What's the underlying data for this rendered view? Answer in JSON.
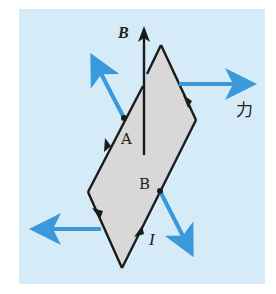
{
  "diagram": {
    "type": "physics-force-on-current-loop",
    "colors": {
      "background": "#d5ebf7",
      "loop_fill": "#d8d8d8",
      "loop_stroke": "#1a1a1a",
      "force_arrow": "#3a9ad9"
    },
    "labels": {
      "field": "B",
      "point_a": "A",
      "point_b": "B",
      "current": "I",
      "force": "力"
    },
    "loop_vertices": {
      "top": [
        161,
        45
      ],
      "right": [
        196,
        120
      ],
      "bottom": [
        122,
        268
      ],
      "left": [
        88,
        192
      ]
    },
    "points": {
      "A": [
        124,
        118
      ],
      "B": [
        160,
        191
      ]
    },
    "field_arrow": {
      "x": 144,
      "y_start": 155,
      "y_end": 26
    },
    "force_arrows": [
      {
        "name": "force-at-A",
        "from": [
          124,
          118
        ],
        "to": [
          92,
          55
        ]
      },
      {
        "name": "force-right",
        "from": [
          179,
          84
        ],
        "to": [
          253,
          84
        ]
      },
      {
        "name": "force-at-B",
        "from": [
          160,
          191
        ],
        "to": [
          192,
          255
        ]
      },
      {
        "name": "force-left",
        "from": [
          101,
          229
        ],
        "to": [
          33,
          229
        ]
      }
    ]
  }
}
